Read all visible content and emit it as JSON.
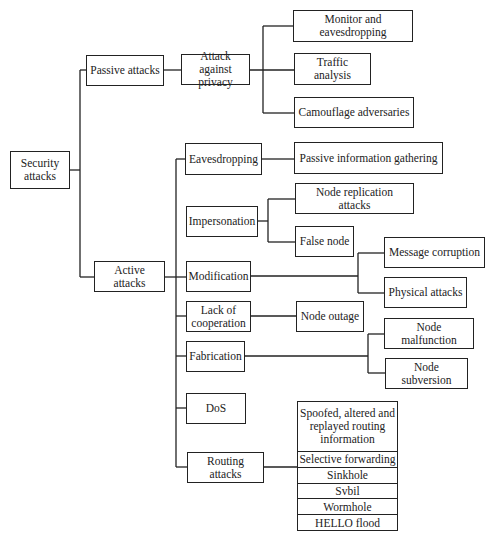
{
  "diagram": {
    "root": "Security attacks",
    "passive": {
      "label": "Passive attacks",
      "child": "Attack against privacy",
      "leaves": [
        "Monitor and eavesdropping",
        "Traffic analysis",
        "Camouflage adversaries"
      ]
    },
    "active": {
      "label": "Active attacks",
      "categories": {
        "eavesdropping": {
          "label": "Eavesdropping",
          "leaves": [
            "Passive information gathering"
          ]
        },
        "impersonation": {
          "label": "Impersonation",
          "leaves": [
            "Node replication attacks",
            "False node"
          ]
        },
        "modification": {
          "label": "Modification",
          "leaves": [
            "Message corruption",
            "Physical attacks"
          ]
        },
        "lack_of_cooperation": {
          "label": "Lack of cooperation",
          "leaves": [
            "Node outage"
          ]
        },
        "fabrication": {
          "label": "Fabrication",
          "leaves": [
            "Node malfunction",
            "Node subversion"
          ]
        },
        "dos": {
          "label": "DoS"
        },
        "routing": {
          "label": "Routing attacks",
          "list_header": "Spoofed, altered and replayed routing information",
          "list": [
            "Selective forwarding",
            "Sinkhole",
            "Svbil",
            "Wormhole",
            "HELLO flood"
          ]
        }
      }
    },
    "colors": {
      "stroke": "#222222",
      "background": "#ffffff",
      "text": "#222222"
    }
  }
}
